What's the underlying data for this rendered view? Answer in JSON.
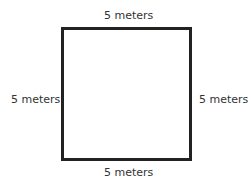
{
  "diagram": {
    "shape": "square",
    "labels": {
      "top": "5 meters",
      "bottom": "5 meters",
      "left": "5 meters",
      "right": "5 meters"
    }
  }
}
